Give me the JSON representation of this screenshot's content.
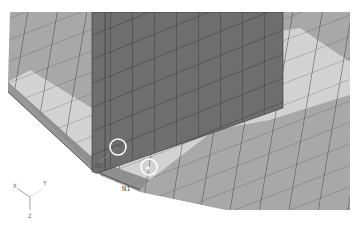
{
  "viewport": {
    "background": "#ffffff",
    "colors": {
      "floor_outer": "#a8a8a8",
      "floor_inner": "#d2d2d2",
      "wall": "#6e6e6e",
      "border_strip": "#8c8c8c",
      "mesh_line": "#3c3c3c",
      "marker": "#ffffff"
    }
  },
  "nodes": [
    {
      "label": "N2",
      "x": 96,
      "y": 166
    },
    {
      "label": "N1",
      "x": 122,
      "y": 189
    }
  ],
  "triad": {
    "x_label": "X",
    "y_label": "Y",
    "z_label": "Z"
  }
}
